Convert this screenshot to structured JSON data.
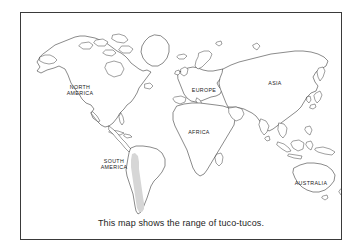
{
  "figure": {
    "kind": "world-map",
    "caption": "This map shows the range of tuco-tucos.",
    "frame_color": "#3a3a3a",
    "background_color": "#ffffff",
    "coastline_color": "#2b2b2b"
  },
  "map": {
    "projection_note": "equirectangular world outline",
    "labels": [
      {
        "id": "north-america",
        "text": "NORTH\nAMERICA",
        "x": 59,
        "y": 74
      },
      {
        "id": "south-america",
        "text": "SOUTH\nAMERICA",
        "x": 93,
        "y": 148
      },
      {
        "id": "europe",
        "text": "EUROPE",
        "x": 183,
        "y": 77
      },
      {
        "id": "africa",
        "text": "AFRICA",
        "x": 178,
        "y": 119
      },
      {
        "id": "asia",
        "text": "ASIA",
        "x": 254,
        "y": 70
      },
      {
        "id": "australia",
        "text": "AUSTRALIA",
        "x": 290,
        "y": 170
      }
    ],
    "range_highlight": {
      "name": "tuco-tuco range",
      "region": "southern South America",
      "fill_color": "#d6d6d6"
    }
  }
}
